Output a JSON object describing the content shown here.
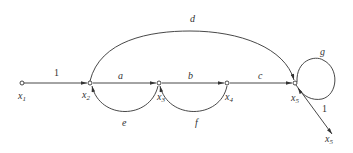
{
  "diagram": {
    "type": "signal-flow-graph",
    "nodes": [
      {
        "id": "x1",
        "label": "x",
        "sub": "1"
      },
      {
        "id": "x2",
        "label": "x",
        "sub": "2"
      },
      {
        "id": "x3",
        "label": "x",
        "sub": "3"
      },
      {
        "id": "x4",
        "label": "x",
        "sub": "4"
      },
      {
        "id": "x5",
        "label": "x",
        "sub": "5"
      },
      {
        "id": "x5out",
        "label": "x",
        "sub": "5"
      }
    ],
    "edges": [
      {
        "from": "x1",
        "to": "x2",
        "gain": "1"
      },
      {
        "from": "x2",
        "to": "x3",
        "gain": "a"
      },
      {
        "from": "x3",
        "to": "x4",
        "gain": "b"
      },
      {
        "from": "x4",
        "to": "x5",
        "gain": "c"
      },
      {
        "from": "x2",
        "to": "x5",
        "gain": "d"
      },
      {
        "from": "x3",
        "to": "x2",
        "gain": "e"
      },
      {
        "from": "x4",
        "to": "x3",
        "gain": "f"
      },
      {
        "from": "x5",
        "to": "x5",
        "gain": "g"
      },
      {
        "from": "x5",
        "to": "x5out",
        "gain": "1"
      }
    ]
  }
}
